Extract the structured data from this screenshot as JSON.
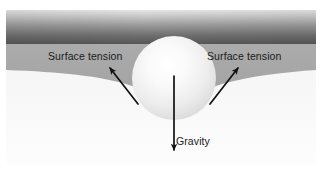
{
  "figure": {
    "width": 324,
    "height": 169,
    "background_color": "#ffffff"
  },
  "labels": {
    "surface_tension_left": "Surface tension",
    "surface_tension_right": "Surface tension",
    "gravity": "Gravity"
  },
  "colors": {
    "page_background": "#ffffff",
    "air_band_top": "#d8d8d8",
    "air_band_bottom": "#555555",
    "water_layer": "#a8a8a8",
    "sub_surface": "#f2f2f2",
    "sphere_highlight": "#fdfdfd",
    "sphere_shadow": "#cfcfcf",
    "arrow_color": "#111111",
    "text_color": "#1a1a1a"
  },
  "elements": {
    "air_band": "dark-gradient-band",
    "water_surface": "gray-liquid-layer",
    "meniscus": "curved-depression-around-sphere",
    "sphere": "floating-sphere",
    "arrow_left": "surface-tension-arrow-up-left",
    "arrow_right": "surface-tension-arrow-up-right",
    "arrow_gravity": "gravity-arrow-down"
  },
  "geometry": {
    "sphere_center_x": 174,
    "sphere_center_y": 78,
    "sphere_radius": 42,
    "air_band_y_start": 10,
    "air_band_y_end": 45,
    "water_y_end": 80,
    "gravity_arrow_y_start": 78,
    "gravity_arrow_y_end": 152
  }
}
